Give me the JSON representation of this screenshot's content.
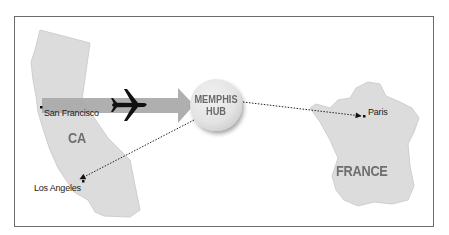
{
  "diagram": {
    "regions": [
      {
        "id": "ca",
        "label": "CA"
      },
      {
        "id": "france",
        "label": "FRANCE"
      }
    ],
    "cities": [
      {
        "id": "san-francisco",
        "label": "San Francisco"
      },
      {
        "id": "los-angeles",
        "label": "Los Angeles"
      },
      {
        "id": "paris",
        "label": "Paris"
      }
    ],
    "hub": {
      "line1": "MEMPHIS",
      "line2": "HUB"
    },
    "connections": [
      {
        "from": "San Francisco",
        "to": "MEMPHIS HUB",
        "style": "wide arrow with airplane"
      },
      {
        "from": "MEMPHIS HUB",
        "to": "Paris",
        "style": "dotted arrow"
      },
      {
        "from": "MEMPHIS HUB",
        "to": "Los Angeles",
        "style": "dotted arrow"
      }
    ],
    "colors": {
      "land": "#dcdcdc",
      "land_edge": "#c8c8c8",
      "arrow": "#a8a8a8",
      "hub": "#e6e6e6",
      "label_gray": "#6e6e6e",
      "frame": "#6b6b6b"
    }
  }
}
